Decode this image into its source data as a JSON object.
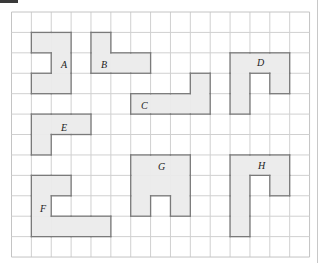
{
  "grid": {
    "cols": 15,
    "rows": 12,
    "origin_x": 11.5,
    "origin_y": 12,
    "cell_w": 19.87,
    "cell_h": 20.42,
    "line_color": "#d0d0d0",
    "border_color": "#c4c4c4"
  },
  "style": {
    "shape_fill": "#ececec",
    "shape_stroke": "#7a7a7a"
  },
  "shapes": [
    {
      "label": "A",
      "cells": [
        [
          1,
          1
        ],
        [
          2,
          1
        ],
        [
          2,
          2
        ],
        [
          1,
          3
        ],
        [
          2,
          3
        ]
      ],
      "label_pos": [
        61,
        68
      ]
    },
    {
      "label": "B",
      "cells": [
        [
          4,
          1
        ],
        [
          4,
          2
        ],
        [
          5,
          2
        ],
        [
          6,
          2
        ]
      ],
      "label_pos": [
        101,
        68
      ]
    },
    {
      "label": "C",
      "cells": [
        [
          9,
          3
        ],
        [
          6,
          4
        ],
        [
          7,
          4
        ],
        [
          8,
          4
        ],
        [
          9,
          4
        ]
      ],
      "label_pos": [
        141,
        109
      ]
    },
    {
      "label": "D",
      "cells": [
        [
          11,
          2
        ],
        [
          12,
          2
        ],
        [
          13,
          2
        ],
        [
          11,
          3
        ],
        [
          13,
          3
        ],
        [
          11,
          4
        ]
      ],
      "label_pos": [
        257,
        66
      ]
    },
    {
      "label": "E",
      "cells": [
        [
          1,
          5
        ],
        [
          2,
          5
        ],
        [
          3,
          5
        ],
        [
          1,
          6
        ]
      ],
      "label_pos": [
        61,
        131
      ]
    },
    {
      "label": "F",
      "cells": [
        [
          1,
          8
        ],
        [
          2,
          8
        ],
        [
          1,
          9
        ],
        [
          1,
          10
        ],
        [
          2,
          10
        ],
        [
          3,
          10
        ],
        [
          4,
          10
        ]
      ],
      "label_pos": [
        40,
        212
      ]
    },
    {
      "label": "G",
      "cells": [
        [
          6,
          7
        ],
        [
          7,
          7
        ],
        [
          8,
          7
        ],
        [
          6,
          8
        ],
        [
          7,
          8
        ],
        [
          8,
          8
        ],
        [
          6,
          9
        ],
        [
          8,
          9
        ]
      ],
      "label_pos": [
        158,
        170
      ]
    },
    {
      "label": "H",
      "cells": [
        [
          11,
          7
        ],
        [
          12,
          7
        ],
        [
          13,
          7
        ],
        [
          11,
          8
        ],
        [
          13,
          8
        ],
        [
          11,
          9
        ],
        [
          11,
          10
        ]
      ],
      "label_pos": [
        258,
        169
      ]
    }
  ]
}
